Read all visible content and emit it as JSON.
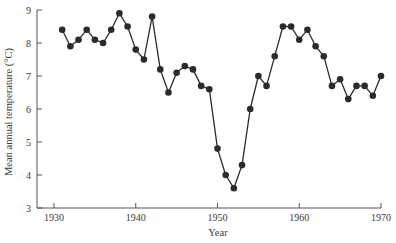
{
  "chart_data": {
    "type": "line",
    "title": "",
    "xlabel": "Year",
    "ylabel": "Mean annual temperature (°C)",
    "xlim": [
      1930,
      1970
    ],
    "ylim": [
      3,
      9
    ],
    "x_ticks": [
      1930,
      1940,
      1950,
      1960,
      1970
    ],
    "y_ticks": [
      3,
      4,
      5,
      6,
      7,
      8,
      9
    ],
    "grid": false,
    "legend": null,
    "markers": "filled-circle",
    "series": [
      {
        "name": "Mean annual temperature",
        "color": "#2b2b2b",
        "x": [
          1931,
          1932,
          1933,
          1934,
          1935,
          1936,
          1937,
          1938,
          1939,
          1940,
          1941,
          1942,
          1943,
          1944,
          1945,
          1946,
          1947,
          1948,
          1949,
          1950,
          1951,
          1952,
          1953,
          1954,
          1955,
          1956,
          1957,
          1958,
          1959,
          1960,
          1961,
          1962,
          1963,
          1964,
          1965,
          1966,
          1967,
          1968,
          1969,
          1970
        ],
        "values": [
          8.4,
          7.9,
          8.1,
          8.4,
          8.1,
          8.0,
          8.4,
          8.9,
          8.5,
          7.8,
          7.5,
          8.8,
          7.2,
          6.5,
          7.1,
          7.3,
          7.2,
          6.7,
          6.6,
          4.8,
          4.0,
          3.6,
          4.3,
          6.0,
          7.0,
          6.7,
          7.6,
          8.5,
          8.5,
          8.1,
          8.4,
          7.9,
          7.6,
          6.7,
          6.9,
          6.3,
          6.7,
          6.7,
          6.4,
          7.0
        ]
      }
    ]
  },
  "colors": {
    "axis": "#555555",
    "line": "#2b2b2b",
    "marker": "#2b2b2b",
    "text": "#3a3a3a",
    "background": "#ffffff"
  }
}
